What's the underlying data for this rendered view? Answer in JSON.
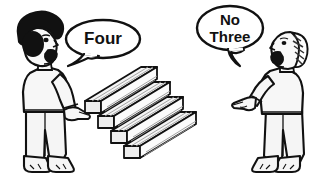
{
  "scene": {
    "title": "Two people arguing about how many wooden beams are stacked",
    "background_color": "#ffffff",
    "ink_color": "#111111",
    "fill_color": "#f2f2f2",
    "width": 322,
    "height": 184
  },
  "speech_bubbles": [
    {
      "id": "left-bubble",
      "speaker": "left-person",
      "lines": [
        "Four"
      ],
      "line1": "Four",
      "tail_direction": "down-left",
      "font_size": 17
    },
    {
      "id": "right-bubble",
      "speaker": "right-person",
      "lines": [
        "No",
        "Three"
      ],
      "line1": "No",
      "line2": "Three",
      "tail_direction": "down-right",
      "font_size": 15
    }
  ],
  "characters": [
    {
      "id": "left-person",
      "name": "left-person",
      "hair": "afro-solid-black",
      "hair_color": "#111111",
      "facing": "right",
      "mouth": "open",
      "gesture": "pointing-down-right",
      "feet": "bare"
    },
    {
      "id": "right-person",
      "name": "right-person",
      "hair": "hatched-striped",
      "hair_color": "#444444",
      "facing": "left",
      "mouth": "open",
      "gesture": "pointing-left",
      "feet": "bare"
    }
  ],
  "objects": {
    "name": "wooden-beams-stack",
    "label": "stack of wooden beams",
    "count": 4,
    "orientation": "isometric-diagonal",
    "beams": [
      {
        "index": 1,
        "offset_x": 0,
        "offset_y": 0
      },
      {
        "index": 2,
        "offset_x": -9,
        "offset_y": 15
      },
      {
        "index": 3,
        "offset_x": -18,
        "offset_y": 30
      },
      {
        "index": 4,
        "offset_x": -27,
        "offset_y": 45
      }
    ]
  }
}
